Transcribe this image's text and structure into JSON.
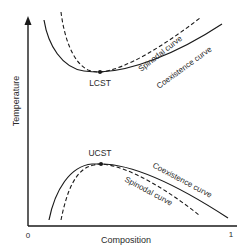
{
  "diagram": {
    "type": "phase-diagram",
    "axes": {
      "x_label": "Composition",
      "y_label": "Temperature",
      "x_min_tick": "0",
      "x_max_tick": "1"
    },
    "upper_region": {
      "critical_point_label": "LCST",
      "coexistence_label": "Coexistence curve",
      "spinodal_label": "Spinodal curve"
    },
    "lower_region": {
      "critical_point_label": "UCST",
      "coexistence_label": "Coexistence curve",
      "spinodal_label": "Spinodal curve"
    },
    "colors": {
      "line": "#1a1a1a",
      "text": "#2a2a2a",
      "background": "#ffffff"
    }
  }
}
